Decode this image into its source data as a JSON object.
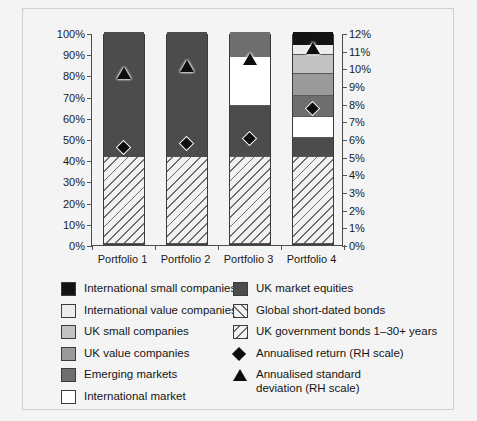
{
  "chart_data": {
    "type": "bar",
    "subtype": "stacked-bar-with-overlay-markers",
    "title": "",
    "xlabel": "",
    "ylabel": "",
    "categories": [
      "Portfolio 1",
      "Portfolio 2",
      "Portfolio 3",
      "Portfolio 4"
    ],
    "left_axis": {
      "label": "",
      "ylim": [
        0,
        100
      ],
      "tick_step": 10,
      "tick_labels": [
        "0%",
        "10%",
        "20%",
        "30%",
        "40%",
        "50%",
        "60%",
        "70%",
        "80%",
        "90%",
        "100%"
      ],
      "unit": "%"
    },
    "right_axis": {
      "label": "RH scale",
      "ylim": [
        0,
        12
      ],
      "tick_step": 1,
      "tick_labels": [
        "0%",
        "1%",
        "2%",
        "3%",
        "4%",
        "5%",
        "6%",
        "7%",
        "8%",
        "9%",
        "10%",
        "11%",
        "12%"
      ],
      "unit": "%"
    },
    "grid": false,
    "legend_position": "bottom",
    "stack_order_bottom_to_top": [
      "UK government bonds 1-30+ years",
      "UK market equities",
      "International market",
      "Emerging markets",
      "UK value companies",
      "UK small companies",
      "International value companies",
      "International small companies"
    ],
    "series": [
      {
        "name": "UK government bonds 1-30+ years",
        "fill": "uk-govt",
        "values": [
          41,
          41,
          41,
          41
        ]
      },
      {
        "name": "UK market equities",
        "fill": "uk-mkt-eq",
        "values": [
          59,
          59,
          24,
          9
        ]
      },
      {
        "name": "International market",
        "fill": "intl-market",
        "values": [
          0,
          0,
          23,
          10
        ]
      },
      {
        "name": "Emerging markets",
        "fill": "emerging",
        "values": [
          0,
          0,
          12,
          10
        ]
      },
      {
        "name": "UK value companies",
        "fill": "uk-value",
        "values": [
          0,
          0,
          0,
          10
        ]
      },
      {
        "name": "UK small companies",
        "fill": "uk-small",
        "values": [
          0,
          0,
          0,
          9
        ]
      },
      {
        "name": "International value companies",
        "fill": "intl-value",
        "values": [
          0,
          0,
          0,
          5
        ]
      },
      {
        "name": "International small companies",
        "fill": "intl-small",
        "values": [
          0,
          0,
          0,
          6
        ]
      }
    ],
    "markers": [
      {
        "name": "Annualised return (RH scale)",
        "symbol": "diamond",
        "axis": "right",
        "values": [
          5.6,
          5.8,
          6.1,
          7.8
        ]
      },
      {
        "name": "Annualised standard deviation (RH scale)",
        "symbol": "triangle",
        "axis": "right",
        "values": [
          9.8,
          10.2,
          10.6,
          11.2
        ]
      }
    ]
  },
  "legend": {
    "left_column": [
      {
        "label": "International small companies",
        "fill": "intl-small"
      },
      {
        "label": "International value companies",
        "fill": "intl-value"
      },
      {
        "label": "UK small companies",
        "fill": "uk-small"
      },
      {
        "label": "UK value companies",
        "fill": "uk-value"
      },
      {
        "label": "Emerging markets",
        "fill": "emerging"
      },
      {
        "label": "International market",
        "fill": "intl-market"
      }
    ],
    "right_column": [
      {
        "label": "UK market equities",
        "fill": "uk-mkt-eq",
        "kind": "swatch"
      },
      {
        "label": "Global short-dated bonds",
        "fill": "global-short",
        "kind": "swatch"
      },
      {
        "label": "UK government bonds 1–30+ years",
        "fill": "uk-govt",
        "kind": "swatch"
      },
      {
        "label": "Annualised return (RH scale)",
        "kind": "diamond"
      },
      {
        "label": "Annualised standard\ndeviation (RH scale)",
        "kind": "triangle"
      }
    ]
  },
  "colors": {
    "intl_small": "#131313",
    "intl_value": "#ececec",
    "uk_small": "#c2c2c2",
    "uk_value": "#9a9a9a",
    "emerging": "#6e6e6e",
    "intl_market": "#ffffff",
    "uk_mkt_eq": "#4c4c4c",
    "hatch_line": "#6d6d6d",
    "axis": "#4a4a4a",
    "background": "#f4f4f4",
    "text": "#141414"
  }
}
